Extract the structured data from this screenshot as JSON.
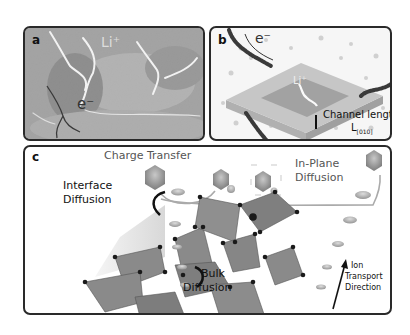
{
  "panels": {
    "a": {
      "label": "a",
      "ion_label": "Li⁺",
      "electron_label": "e⁻"
    },
    "b": {
      "label": "b",
      "electron_label": "e⁻",
      "ion_label": "Li⁺",
      "channel_label": "Channel length",
      "channel_symbol": "L",
      "channel_subscript": "[010]"
    },
    "c": {
      "label": "c",
      "charge_transfer": "Charge Transfer",
      "in_plane_line1": "In-Plane",
      "in_plane_line2": "Diffusion",
      "interface_line1": "Interface",
      "interface_line2": "Diffusion",
      "bulk_line1": "Bulk",
      "bulk_line2": "Diffusion",
      "ion_line1": "Ion",
      "ion_line2": "Transport",
      "ion_line3": "Direction"
    }
  },
  "colors": {
    "border": "#2a2a2a",
    "octahedron_fill": "#7a7a7a",
    "node": "#1a1a1a",
    "particle": "#8c8c8c"
  }
}
